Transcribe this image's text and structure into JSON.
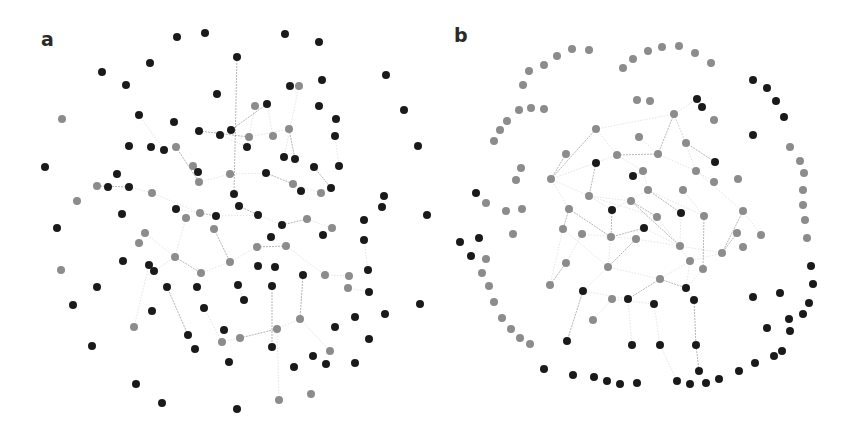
{
  "figure": {
    "panels": [
      {
        "id": "a",
        "label": "a"
      },
      {
        "id": "b",
        "label": "b"
      }
    ],
    "colors": {
      "dark_node": "#1a1a1a",
      "gray_node": "#8c8c8c",
      "edge": "#9a9a9a",
      "background": "#ffffff"
    },
    "node_radius": 4
  },
  "network_a": {
    "dark_nodes": [
      [
        177,
        37
      ],
      [
        205,
        33
      ],
      [
        285,
        34
      ],
      [
        319,
        42
      ],
      [
        237,
        57
      ],
      [
        150,
        63
      ],
      [
        102,
        72
      ],
      [
        386,
        75
      ],
      [
        126,
        85
      ],
      [
        322,
        80
      ],
      [
        290,
        86
      ],
      [
        217,
        94
      ],
      [
        404,
        110
      ],
      [
        267,
        104
      ],
      [
        319,
        106
      ],
      [
        139,
        115
      ],
      [
        174,
        122
      ],
      [
        336,
        119
      ],
      [
        335,
        136
      ],
      [
        418,
        146
      ],
      [
        199,
        131
      ],
      [
        220,
        135
      ],
      [
        231,
        130
      ],
      [
        129,
        146
      ],
      [
        151,
        147
      ],
      [
        164,
        150
      ],
      [
        247,
        147
      ],
      [
        45,
        167
      ],
      [
        284,
        157
      ],
      [
        295,
        159
      ],
      [
        314,
        167
      ],
      [
        339,
        166
      ],
      [
        117,
        174
      ],
      [
        198,
        172
      ],
      [
        266,
        173
      ],
      [
        108,
        187
      ],
      [
        129,
        187
      ],
      [
        301,
        191
      ],
      [
        331,
        188
      ],
      [
        234,
        194
      ],
      [
        384,
        196
      ],
      [
        382,
        207
      ],
      [
        427,
        215
      ],
      [
        176,
        209
      ],
      [
        239,
        206
      ],
      [
        122,
        214
      ],
      [
        216,
        216
      ],
      [
        258,
        215
      ],
      [
        57,
        228
      ],
      [
        282,
        225
      ],
      [
        364,
        220
      ],
      [
        323,
        235
      ],
      [
        271,
        237
      ],
      [
        364,
        240
      ],
      [
        123,
        261
      ],
      [
        149,
        265
      ],
      [
        154,
        271
      ],
      [
        258,
        266
      ],
      [
        275,
        267
      ],
      [
        368,
        270
      ],
      [
        303,
        275
      ],
      [
        97,
        287
      ],
      [
        167,
        287
      ],
      [
        197,
        287
      ],
      [
        238,
        285
      ],
      [
        272,
        286
      ],
      [
        369,
        292
      ],
      [
        244,
        300
      ],
      [
        73,
        305
      ],
      [
        152,
        311
      ],
      [
        204,
        308
      ],
      [
        420,
        304
      ],
      [
        385,
        314
      ],
      [
        355,
        317
      ],
      [
        335,
        327
      ],
      [
        224,
        330
      ],
      [
        188,
        335
      ],
      [
        369,
        339
      ],
      [
        92,
        346
      ],
      [
        195,
        349
      ],
      [
        272,
        347
      ],
      [
        313,
        356
      ],
      [
        229,
        362
      ],
      [
        294,
        367
      ],
      [
        326,
        364
      ],
      [
        355,
        363
      ],
      [
        136,
        384
      ],
      [
        162,
        403
      ],
      [
        237,
        409
      ]
    ],
    "gray_nodes": [
      [
        299,
        86
      ],
      [
        62,
        119
      ],
      [
        255,
        106
      ],
      [
        176,
        147
      ],
      [
        249,
        137
      ],
      [
        273,
        136
      ],
      [
        289,
        129
      ],
      [
        193,
        166
      ],
      [
        230,
        174
      ],
      [
        199,
        182
      ],
      [
        97,
        186
      ],
      [
        152,
        193
      ],
      [
        293,
        184
      ],
      [
        321,
        193
      ],
      [
        77,
        201
      ],
      [
        200,
        213
      ],
      [
        186,
        218
      ],
      [
        214,
        229
      ],
      [
        307,
        219
      ],
      [
        332,
        228
      ],
      [
        145,
        233
      ],
      [
        139,
        243
      ],
      [
        257,
        247
      ],
      [
        286,
        246
      ],
      [
        175,
        257
      ],
      [
        230,
        262
      ],
      [
        61,
        270
      ],
      [
        201,
        273
      ],
      [
        325,
        275
      ],
      [
        349,
        276
      ],
      [
        348,
        288
      ],
      [
        134,
        327
      ],
      [
        277,
        329
      ],
      [
        300,
        319
      ],
      [
        222,
        342
      ],
      [
        240,
        338
      ],
      [
        330,
        351
      ],
      [
        279,
        400
      ],
      [
        311,
        394
      ]
    ],
    "edges": [
      [
        199,
        131,
        249,
        137
      ],
      [
        249,
        137,
        289,
        129
      ],
      [
        220,
        135,
        247,
        147
      ],
      [
        176,
        147,
        199,
        182
      ],
      [
        199,
        182,
        230,
        174
      ],
      [
        230,
        174,
        266,
        173
      ],
      [
        266,
        173,
        293,
        184
      ],
      [
        293,
        184,
        321,
        193
      ],
      [
        152,
        193,
        200,
        213
      ],
      [
        200,
        213,
        216,
        216
      ],
      [
        216,
        216,
        258,
        215
      ],
      [
        258,
        215,
        282,
        225
      ],
      [
        282,
        225,
        307,
        219
      ],
      [
        307,
        219,
        332,
        228
      ],
      [
        145,
        233,
        175,
        257
      ],
      [
        175,
        257,
        201,
        273
      ],
      [
        201,
        273,
        230,
        262
      ],
      [
        230,
        262,
        257,
        247
      ],
      [
        257,
        247,
        286,
        246
      ],
      [
        286,
        246,
        325,
        275
      ],
      [
        325,
        275,
        349,
        276
      ],
      [
        97,
        186,
        129,
        187
      ],
      [
        129,
        187,
        152,
        193
      ],
      [
        193,
        166,
        199,
        182
      ],
      [
        237,
        57,
        234,
        194
      ],
      [
        139,
        115,
        164,
        150
      ],
      [
        255,
        106,
        247,
        147
      ],
      [
        289,
        129,
        295,
        159
      ],
      [
        299,
        86,
        284,
        157
      ],
      [
        335,
        136,
        339,
        166
      ],
      [
        314,
        167,
        331,
        188
      ],
      [
        204,
        308,
        222,
        342
      ],
      [
        222,
        342,
        240,
        338
      ],
      [
        240,
        338,
        277,
        329
      ],
      [
        277,
        329,
        300,
        319
      ],
      [
        300,
        319,
        330,
        351
      ],
      [
        188,
        335,
        167,
        287
      ],
      [
        154,
        271,
        175,
        257
      ],
      [
        244,
        300,
        238,
        285
      ],
      [
        272,
        286,
        272,
        347
      ],
      [
        279,
        400,
        277,
        329
      ],
      [
        108,
        187,
        97,
        186
      ],
      [
        214,
        229,
        230,
        262
      ],
      [
        186,
        218,
        175,
        257
      ],
      [
        149,
        265,
        134,
        327
      ],
      [
        303,
        275,
        300,
        319
      ],
      [
        348,
        288,
        369,
        292
      ],
      [
        364,
        240,
        368,
        270
      ],
      [
        231,
        130,
        267,
        104
      ],
      [
        267,
        104,
        273,
        136
      ],
      [
        176,
        209,
        200,
        213
      ],
      [
        239,
        206,
        258,
        215
      ]
    ]
  },
  "network_b": {
    "dark_nodes": [
      [
        753,
        80
      ],
      [
        767,
        88
      ],
      [
        776,
        101
      ],
      [
        784,
        117
      ],
      [
        697,
        99
      ],
      [
        702,
        107
      ],
      [
        753,
        135
      ],
      [
        715,
        162
      ],
      [
        596,
        163
      ],
      [
        633,
        176
      ],
      [
        612,
        210
      ],
      [
        681,
        213
      ],
      [
        644,
        228
      ],
      [
        476,
        193
      ],
      [
        479,
        238
      ],
      [
        460,
        242
      ],
      [
        471,
        256
      ],
      [
        583,
        291
      ],
      [
        628,
        299
      ],
      [
        654,
        304
      ],
      [
        686,
        288
      ],
      [
        694,
        300
      ],
      [
        811,
        266
      ],
      [
        813,
        284
      ],
      [
        780,
        293
      ],
      [
        753,
        297
      ],
      [
        809,
        303
      ],
      [
        803,
        314
      ],
      [
        789,
        319
      ],
      [
        790,
        331
      ],
      [
        767,
        328
      ],
      [
        567,
        341
      ],
      [
        632,
        345
      ],
      [
        660,
        345
      ],
      [
        696,
        345
      ],
      [
        782,
        351
      ],
      [
        774,
        356
      ],
      [
        755,
        363
      ],
      [
        739,
        371
      ],
      [
        544,
        369
      ],
      [
        573,
        375
      ],
      [
        594,
        377
      ],
      [
        607,
        381
      ],
      [
        620,
        384
      ],
      [
        637,
        383
      ],
      [
        677,
        381
      ],
      [
        690,
        384
      ],
      [
        706,
        383
      ],
      [
        719,
        379
      ],
      [
        699,
        371
      ]
    ],
    "gray_nodes": [
      [
        572,
        49
      ],
      [
        589,
        50
      ],
      [
        557,
        56
      ],
      [
        544,
        65
      ],
      [
        529,
        71
      ],
      [
        523,
        85
      ],
      [
        623,
        68
      ],
      [
        633,
        59
      ],
      [
        648,
        51
      ],
      [
        662,
        47
      ],
      [
        679,
        46
      ],
      [
        695,
        53
      ],
      [
        711,
        63
      ],
      [
        637,
        100
      ],
      [
        650,
        101
      ],
      [
        519,
        110
      ],
      [
        531,
        108
      ],
      [
        544,
        109
      ],
      [
        507,
        121
      ],
      [
        500,
        130
      ],
      [
        494,
        141
      ],
      [
        714,
        120
      ],
      [
        790,
        147
      ],
      [
        800,
        161
      ],
      [
        804,
        173
      ],
      [
        803,
        190
      ],
      [
        803,
        205
      ],
      [
        805,
        220
      ],
      [
        807,
        238
      ],
      [
        521,
        168
      ],
      [
        516,
        180
      ],
      [
        486,
        203
      ],
      [
        506,
        211
      ],
      [
        522,
        209
      ],
      [
        513,
        234
      ],
      [
        486,
        259
      ],
      [
        482,
        273
      ],
      [
        489,
        286
      ],
      [
        494,
        302
      ],
      [
        502,
        318
      ],
      [
        511,
        329
      ],
      [
        520,
        338
      ],
      [
        530,
        344
      ],
      [
        761,
        235
      ],
      [
        743,
        247
      ],
      [
        738,
        179
      ],
      [
        714,
        182
      ],
      [
        596,
        129
      ],
      [
        674,
        114
      ],
      [
        639,
        137
      ],
      [
        686,
        143
      ],
      [
        566,
        154
      ],
      [
        617,
        155
      ],
      [
        658,
        154
      ],
      [
        551,
        179
      ],
      [
        643,
        171
      ],
      [
        696,
        171
      ],
      [
        648,
        190
      ],
      [
        589,
        196
      ],
      [
        683,
        190
      ],
      [
        631,
        201
      ],
      [
        569,
        209
      ],
      [
        657,
        217
      ],
      [
        704,
        216
      ],
      [
        743,
        211
      ],
      [
        563,
        229
      ],
      [
        582,
        234
      ],
      [
        611,
        237
      ],
      [
        636,
        239
      ],
      [
        737,
        233
      ],
      [
        680,
        246
      ],
      [
        722,
        253
      ],
      [
        566,
        263
      ],
      [
        608,
        267
      ],
      [
        690,
        261
      ],
      [
        703,
        269
      ],
      [
        660,
        279
      ],
      [
        550,
        285
      ],
      [
        612,
        299
      ],
      [
        593,
        320
      ]
    ],
    "edges": [
      [
        596,
        129,
        551,
        179
      ],
      [
        596,
        129,
        617,
        155
      ],
      [
        596,
        129,
        674,
        114
      ],
      [
        674,
        114,
        658,
        154
      ],
      [
        674,
        114,
        696,
        171
      ],
      [
        551,
        179,
        569,
        209
      ],
      [
        569,
        209,
        563,
        229
      ],
      [
        563,
        229,
        550,
        285
      ],
      [
        551,
        179,
        617,
        155
      ],
      [
        617,
        155,
        658,
        154
      ],
      [
        658,
        154,
        696,
        171
      ],
      [
        696,
        171,
        743,
        211
      ],
      [
        743,
        211,
        722,
        253
      ],
      [
        722,
        253,
        690,
        261
      ],
      [
        690,
        261,
        660,
        279
      ],
      [
        660,
        279,
        628,
        299
      ],
      [
        628,
        299,
        583,
        291
      ],
      [
        583,
        291,
        608,
        267
      ],
      [
        608,
        267,
        636,
        239
      ],
      [
        636,
        239,
        680,
        246
      ],
      [
        680,
        246,
        722,
        253
      ],
      [
        612,
        210,
        611,
        237
      ],
      [
        611,
        237,
        608,
        267
      ],
      [
        612,
        210,
        648,
        190
      ],
      [
        648,
        190,
        681,
        213
      ],
      [
        681,
        213,
        680,
        246
      ],
      [
        644,
        228,
        680,
        246
      ],
      [
        644,
        228,
        611,
        237
      ],
      [
        643,
        171,
        648,
        190
      ],
      [
        633,
        176,
        643,
        171
      ],
      [
        596,
        163,
        589,
        196
      ],
      [
        589,
        196,
        612,
        210
      ],
      [
        657,
        217,
        690,
        261
      ],
      [
        657,
        217,
        631,
        201
      ],
      [
        631,
        201,
        589,
        196
      ],
      [
        683,
        190,
        704,
        216
      ],
      [
        704,
        216,
        703,
        269
      ],
      [
        703,
        269,
        686,
        288
      ],
      [
        686,
        288,
        694,
        300
      ],
      [
        694,
        300,
        696,
        345
      ],
      [
        654,
        304,
        660,
        345
      ],
      [
        628,
        299,
        632,
        345
      ],
      [
        583,
        291,
        567,
        341
      ],
      [
        593,
        320,
        612,
        299
      ],
      [
        612,
        299,
        654,
        304
      ],
      [
        550,
        285,
        566,
        263
      ],
      [
        566,
        263,
        582,
        234
      ],
      [
        582,
        234,
        636,
        239
      ],
      [
        737,
        233,
        722,
        253
      ],
      [
        743,
        211,
        761,
        235
      ],
      [
        714,
        182,
        696,
        171
      ],
      [
        715,
        162,
        686,
        143
      ],
      [
        686,
        143,
        674,
        114
      ],
      [
        639,
        137,
        658,
        154
      ],
      [
        566,
        154,
        551,
        179
      ],
      [
        697,
        99,
        674,
        114
      ],
      [
        690,
        261,
        686,
        288
      ],
      [
        660,
        279,
        686,
        288
      ],
      [
        608,
        267,
        660,
        279
      ],
      [
        563,
        229,
        608,
        267
      ],
      [
        569,
        209,
        611,
        237
      ],
      [
        617,
        155,
        643,
        171
      ],
      [
        589,
        196,
        657,
        217
      ],
      [
        631,
        201,
        680,
        246
      ],
      [
        648,
        190,
        704,
        216
      ],
      [
        551,
        179,
        589,
        196
      ],
      [
        699,
        371,
        696,
        345
      ],
      [
        677,
        381,
        660,
        345
      ]
    ]
  }
}
